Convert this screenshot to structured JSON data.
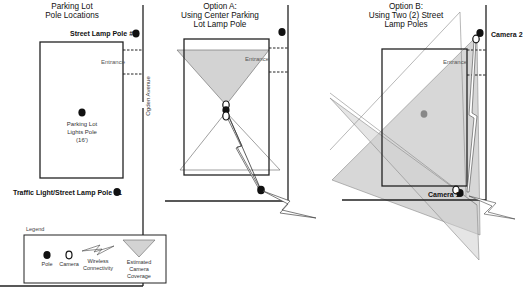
{
  "panels": [
    {
      "title_lines": [
        "Parking Lot",
        "Pole Locations"
      ],
      "labels": {
        "pole2": "Street Lamp Pole #2",
        "entrance": "Entrance",
        "street": "Ogden Avenue",
        "center_pole_lines": [
          "Parking Lot",
          "Lights Pole",
          "(16')"
        ],
        "pole1": "Traffic Light/Street Lamp Pole #1"
      }
    },
    {
      "title_lines": [
        "Option A:",
        "Using Center Parking",
        "Lot Lamp Pole"
      ],
      "labels": {
        "entrance": "Entrance"
      }
    },
    {
      "title_lines": [
        "Option B:",
        "Using Two (2) Street",
        "Lamp Poles"
      ],
      "labels": {
        "entrance": "Entrance",
        "camera1": "Camera 1",
        "camera2": "Camera 2"
      }
    }
  ],
  "legend": {
    "title": "Legend",
    "items": [
      {
        "icon": "pole-icon",
        "label_lines": [
          "Pole"
        ]
      },
      {
        "icon": "camera-icon",
        "label_lines": [
          "Camera"
        ]
      },
      {
        "icon": "wireless-icon",
        "label_lines": [
          "Wireless",
          "Connectivity"
        ]
      },
      {
        "icon": "coverage-icon",
        "label_lines": [
          "Estimated",
          "Camera",
          "Coverage"
        ]
      }
    ]
  },
  "colors": {
    "coverage_fill": "#d3d3d3",
    "line": "#222222",
    "outline": "#777777"
  }
}
